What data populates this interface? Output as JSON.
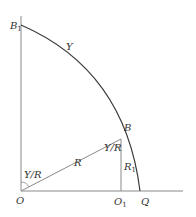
{
  "diagram": {
    "colors": {
      "axis": "#8a8a8a",
      "arc": "#3a3a3a",
      "line": "#8a8a8a",
      "text": "#333333"
    },
    "labels": {
      "B1": {
        "main": "B",
        "sub": "1"
      },
      "Y": "Y",
      "B": "B",
      "angle_at_B": "Y/R",
      "R": "R",
      "R1": {
        "main": "R",
        "sub": "1"
      },
      "angle_at_O": "Y/R",
      "O": "O",
      "O1": {
        "main": "O",
        "sub": "1"
      },
      "Q": "Q"
    },
    "points": {
      "O": [
        21,
        191
      ],
      "B1": [
        21,
        25
      ],
      "B": [
        121,
        139
      ],
      "O1": [
        121,
        191
      ],
      "Q": [
        140,
        191
      ]
    }
  }
}
